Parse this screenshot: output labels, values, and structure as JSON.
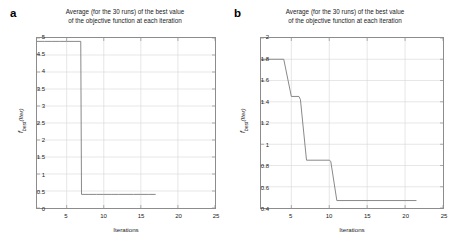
{
  "figure": {
    "panels": [
      {
        "letter": "a",
        "title_line1": "Average (for the 30 runs) of the best value",
        "title_line2": "of the objective function at each iteration",
        "ylabel_main": "f",
        "ylabel_sub": "best",
        "ylabel_paren": "(Iter)",
        "xlabel": "Iterations"
      },
      {
        "letter": "b",
        "title_line1": "Average (for the 30 runs) of the best value",
        "title_line2": "of the objective function at each iteration",
        "ylabel_main": "f",
        "ylabel_sub": "best",
        "ylabel_paren": "(Iter)",
        "xlabel": "Iterations"
      }
    ]
  },
  "chart_data": [
    {
      "type": "line",
      "panel": "a",
      "title": "Average (for the 30 runs) of the best value of the objective function at each iteration",
      "xlabel": "Iterations",
      "ylabel": "f_best (Iter)",
      "xlim": [
        1,
        25
      ],
      "ylim": [
        0,
        5
      ],
      "xticks": [
        5,
        10,
        15,
        20,
        25
      ],
      "yticks": [
        0,
        0.5,
        1,
        1.5,
        2,
        2.5,
        3,
        3.5,
        4,
        4.5,
        5
      ],
      "grid": true,
      "legend": "none",
      "line_color": "#7a7a7a",
      "x": [
        1,
        2,
        3,
        4,
        5,
        6,
        6.9,
        7,
        8,
        9,
        10,
        11,
        12,
        13,
        14,
        15,
        16,
        17
      ],
      "y": [
        4.9,
        4.9,
        4.9,
        4.9,
        4.9,
        4.9,
        4.9,
        0.4,
        0.4,
        0.4,
        0.4,
        0.4,
        0.4,
        0.4,
        0.4,
        0.4,
        0.4,
        0.4
      ]
    },
    {
      "type": "line",
      "panel": "b",
      "title": "Average (for the 30 runs) of the best value of the objective function at each iteration",
      "xlabel": "Iterations",
      "ylabel": "f_best (Iter)",
      "xlim": [
        1,
        25
      ],
      "ylim": [
        0.4,
        2
      ],
      "xticks": [
        5,
        10,
        15,
        20,
        25
      ],
      "yticks": [
        0.4,
        0.6,
        0.8,
        1,
        1.2,
        1.4,
        1.6,
        1.8,
        2
      ],
      "grid": true,
      "legend": "none",
      "line_color": "#7a7a7a",
      "x": [
        1,
        4,
        5,
        6,
        6.2,
        7,
        10,
        10.2,
        11,
        21.5
      ],
      "y": [
        1.8,
        1.8,
        1.45,
        1.45,
        1.42,
        0.85,
        0.85,
        0.84,
        0.47,
        0.47
      ]
    }
  ]
}
